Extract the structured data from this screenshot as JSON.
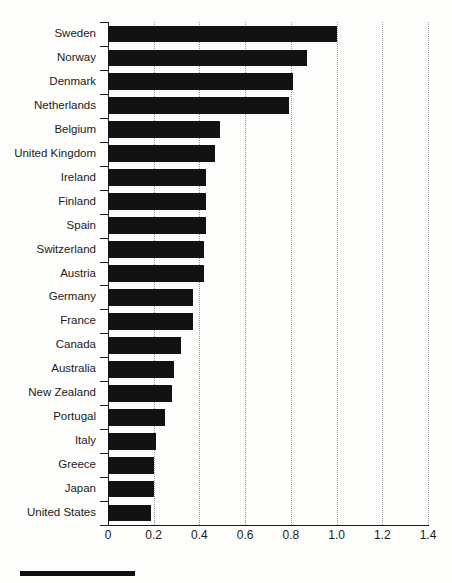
{
  "chart_data": {
    "type": "bar",
    "orientation": "horizontal",
    "title": "",
    "xlabel": "",
    "ylabel": "",
    "xlim": [
      0,
      1.4
    ],
    "xticks": [
      0,
      0.2,
      0.4,
      0.6,
      0.8,
      1.0,
      1.2,
      1.4
    ],
    "xticklabels": [
      "0",
      "0.2",
      "0.4",
      "0.6",
      "0.8",
      "1.0",
      "1.2",
      "1.4"
    ],
    "grid": "vertical-dotted",
    "legend": "none",
    "bar_color": "#121212",
    "categories": [
      "Sweden",
      "Norway",
      "Denmark",
      "Netherlands",
      "Belgium",
      "United Kingdom",
      "Ireland",
      "Finland",
      "Spain",
      "Switzerland",
      "Austria",
      "Germany",
      "France",
      "Canada",
      "Australia",
      "New Zealand",
      "Portugal",
      "Italy",
      "Greece",
      "Japan",
      "United States"
    ],
    "values": [
      1.0,
      0.87,
      0.81,
      0.79,
      0.49,
      0.47,
      0.43,
      0.43,
      0.43,
      0.42,
      0.42,
      0.37,
      0.37,
      0.32,
      0.29,
      0.28,
      0.25,
      0.21,
      0.2,
      0.2,
      0.19
    ]
  },
  "decor": {
    "bleed_text_a": "",
    "bleed_text_b": ""
  }
}
